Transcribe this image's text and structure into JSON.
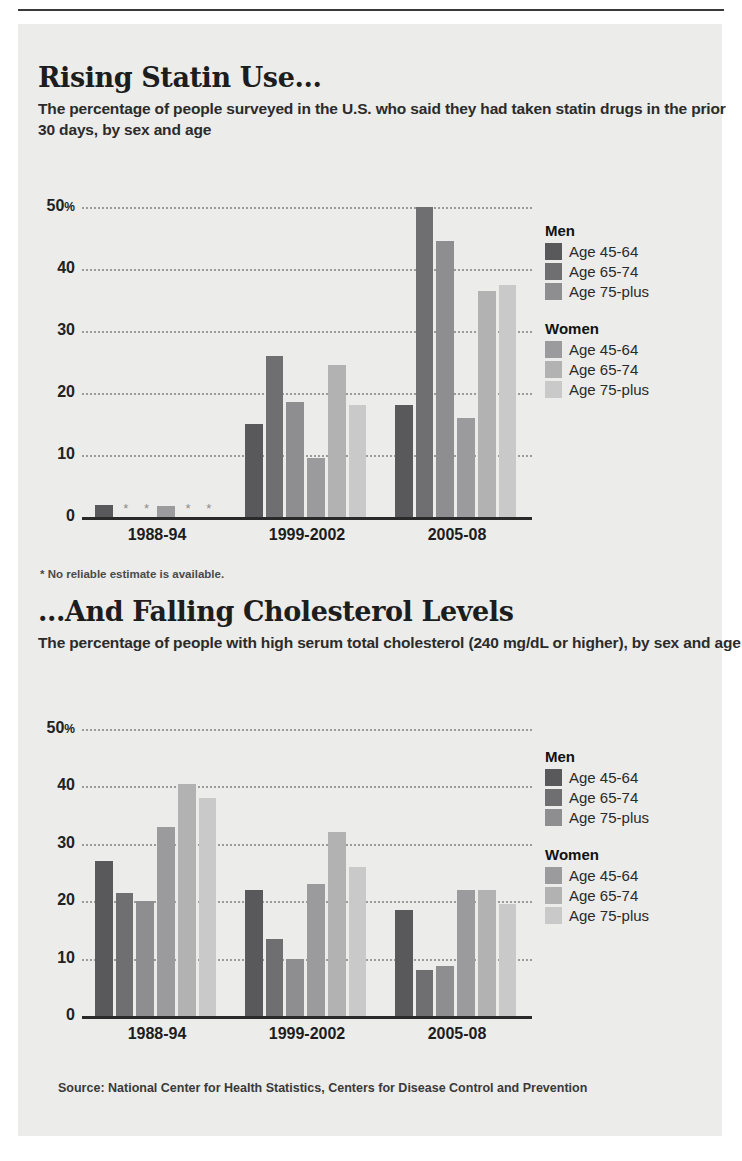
{
  "colors": {
    "paper": "#ececea",
    "men_45_64": "#59595b",
    "men_65_74": "#6f6f71",
    "men_75_plus": "#8e8e90",
    "women_45_64": "#9b9b9d",
    "women_65_74": "#b2b2b3",
    "women_75_plus": "#c9c9c9",
    "axis": "#2a2a2a",
    "grid": "#8e8e8c"
  },
  "legend": {
    "men_heading": "Men",
    "women_heading": "Women",
    "items": [
      {
        "group": "Men",
        "label": "Age 45-64",
        "color_key": "men_45_64"
      },
      {
        "group": "Men",
        "label": "Age 65-74",
        "color_key": "men_65_74"
      },
      {
        "group": "Men",
        "label": "Age 75-plus",
        "color_key": "men_75_plus"
      },
      {
        "group": "Women",
        "label": "Age 45-64",
        "color_key": "women_45_64"
      },
      {
        "group": "Women",
        "label": "Age 65-74",
        "color_key": "women_65_74"
      },
      {
        "group": "Women",
        "label": "Age 75-plus",
        "color_key": "women_75_plus"
      }
    ]
  },
  "chart1": {
    "footnote": "* No reliable estimate is available.",
    "missing_marker": "*"
  },
  "chart2": {
    "source": "Source: National Center for Health Statistics, Centers for Disease Control and Prevention"
  },
  "chart_data": [
    {
      "type": "bar",
      "title": "Rising Statin Use...",
      "subtitle": "The percentage of people surveyed in the U.S. who said they had taken statin drugs in the prior 30 days, by sex and age",
      "xlabel": "",
      "ylabel": "",
      "ylim": [
        0,
        50
      ],
      "yticks": [
        0,
        10,
        20,
        30,
        40,
        50
      ],
      "ytick_labels": [
        "0",
        "10",
        "20",
        "30",
        "40",
        "50%"
      ],
      "grid": true,
      "legend_position": "right",
      "categories": [
        "1988-94",
        "1999-2002",
        "2005-08"
      ],
      "series": [
        {
          "name": "Men Age 45-64",
          "values": [
            2.0,
            15.0,
            18.0
          ]
        },
        {
          "name": "Men Age 65-74",
          "values": [
            null,
            26.0,
            50.0
          ]
        },
        {
          "name": "Men Age 75-plus",
          "values": [
            null,
            18.5,
            44.5
          ]
        },
        {
          "name": "Women Age 45-64",
          "values": [
            1.8,
            9.5,
            16.0
          ]
        },
        {
          "name": "Women Age 65-74",
          "values": [
            null,
            24.5,
            36.5
          ]
        },
        {
          "name": "Women Age 75-plus",
          "values": [
            null,
            18.0,
            37.5
          ]
        }
      ],
      "null_note": "* No reliable estimate is available."
    },
    {
      "type": "bar",
      "title": "...And Falling Cholesterol Levels",
      "subtitle": "The percentage of people with high serum total cholesterol (240 mg/dL or higher), by sex and age",
      "xlabel": "",
      "ylabel": "",
      "ylim": [
        0,
        50
      ],
      "yticks": [
        0,
        10,
        20,
        30,
        40,
        50
      ],
      "ytick_labels": [
        "0",
        "10",
        "20",
        "30",
        "40",
        "50%"
      ],
      "grid": true,
      "legend_position": "right",
      "categories": [
        "1988-94",
        "1999-2002",
        "2005-08"
      ],
      "series": [
        {
          "name": "Men Age 45-64",
          "values": [
            27.0,
            22.0,
            18.5
          ]
        },
        {
          "name": "Men Age 65-74",
          "values": [
            21.5,
            13.5,
            8.0
          ]
        },
        {
          "name": "Men Age 75-plus",
          "values": [
            20.0,
            10.0,
            8.8
          ]
        },
        {
          "name": "Women Age 45-64",
          "values": [
            33.0,
            23.0,
            22.0
          ]
        },
        {
          "name": "Women Age 65-74",
          "values": [
            40.5,
            32.0,
            22.0
          ]
        },
        {
          "name": "Women Age 75-plus",
          "values": [
            38.0,
            26.0,
            19.5
          ]
        }
      ],
      "source": "Source: National Center for Health Statistics, Centers for Disease Control and Prevention"
    }
  ]
}
